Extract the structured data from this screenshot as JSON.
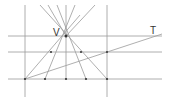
{
  "diagram": {
    "labels": {
      "vertex": "V",
      "transversal": "T"
    },
    "colors": {
      "line": "#9a9a9a",
      "point": "#333333",
      "text": "#333333"
    },
    "horizontal_lines_y": [
      36,
      52,
      79
    ],
    "vertical_lines_x": [
      25,
      66,
      107
    ],
    "vertex": [
      66,
      36
    ],
    "bottom_points_x": [
      25,
      45,
      66,
      86,
      107
    ],
    "transversal": {
      "from": [
        25,
        79
      ],
      "to": [
        162,
        34
      ]
    }
  }
}
